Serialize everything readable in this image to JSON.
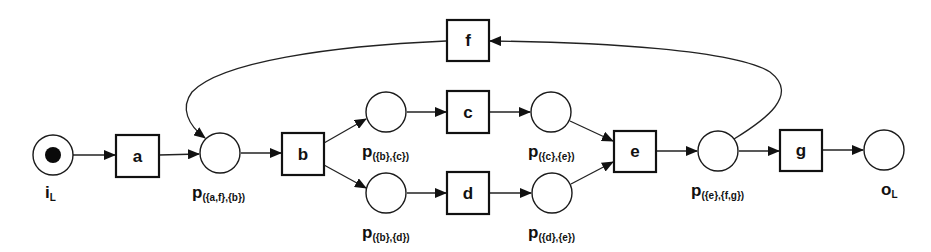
{
  "diagram": {
    "type": "petri-net",
    "colors": {
      "stroke": "#1a1a1a",
      "fill": "#ffffff",
      "token": "#0a0a0a"
    },
    "places": [
      {
        "id": "iL",
        "main": "i",
        "sub": "L",
        "tokens": 1
      },
      {
        "id": "p_af_b",
        "main": "p",
        "sub": "({a,f},{b})",
        "tokens": 0
      },
      {
        "id": "p_b_c",
        "main": "p",
        "sub": "({b},{c})",
        "tokens": 0
      },
      {
        "id": "p_b_d",
        "main": "p",
        "sub": "({b},{d})",
        "tokens": 0
      },
      {
        "id": "p_c_e",
        "main": "p",
        "sub": "({c},{e})",
        "tokens": 0
      },
      {
        "id": "p_d_e",
        "main": "p",
        "sub": "({d},{e})",
        "tokens": 0
      },
      {
        "id": "p_e_fg",
        "main": "p",
        "sub": "({e},{f,g})",
        "tokens": 0
      },
      {
        "id": "oL",
        "main": "o",
        "sub": "L",
        "tokens": 0
      }
    ],
    "transitions": [
      {
        "id": "a",
        "label": "a"
      },
      {
        "id": "b",
        "label": "b"
      },
      {
        "id": "c",
        "label": "c"
      },
      {
        "id": "d",
        "label": "d"
      },
      {
        "id": "e",
        "label": "e"
      },
      {
        "id": "f",
        "label": "f"
      },
      {
        "id": "g",
        "label": "g"
      }
    ],
    "arcs": [
      [
        "iL",
        "a"
      ],
      [
        "a",
        "p_af_b"
      ],
      [
        "p_af_b",
        "b"
      ],
      [
        "b",
        "p_b_c"
      ],
      [
        "b",
        "p_b_d"
      ],
      [
        "p_b_c",
        "c"
      ],
      [
        "p_b_d",
        "d"
      ],
      [
        "c",
        "p_c_e"
      ],
      [
        "d",
        "p_d_e"
      ],
      [
        "p_c_e",
        "e"
      ],
      [
        "p_d_e",
        "e"
      ],
      [
        "e",
        "p_e_fg"
      ],
      [
        "p_e_fg",
        "g"
      ],
      [
        "g",
        "oL"
      ],
      [
        "p_e_fg",
        "f"
      ],
      [
        "f",
        "p_af_b"
      ]
    ]
  }
}
